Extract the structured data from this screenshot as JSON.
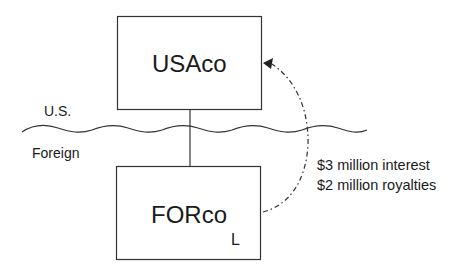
{
  "diagram": {
    "type": "corporate-structure",
    "entities": [
      {
        "id": "usaco",
        "label": "USAco",
        "jurisdiction": "U.S."
      },
      {
        "id": "forco",
        "label": "FORco",
        "jurisdiction": "Foreign",
        "marker": "L"
      }
    ],
    "regions": {
      "upper": "U.S.",
      "lower": "Foreign"
    },
    "border": {
      "style": "wavy"
    },
    "ownership_link": {
      "from": "usaco",
      "to": "forco"
    },
    "payment_flow": {
      "from": "forco",
      "to": "usaco",
      "line_style": "dash-dot",
      "lines": [
        "$3 million interest",
        "$2 million royalties"
      ]
    },
    "colors": {
      "stroke": "#333333",
      "text": "#1a1a1a",
      "background": "#ffffff"
    }
  }
}
